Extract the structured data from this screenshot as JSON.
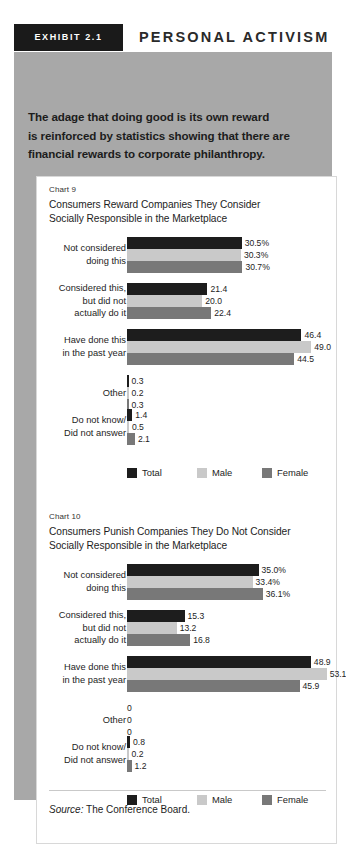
{
  "header": {
    "badge": "EXHIBIT 2.1",
    "title": "PERSONAL ACTIVISM"
  },
  "intro": {
    "line1": "The adage that doing good is its own reward",
    "line2": "is reinforced by statistics showing that there are",
    "line3": "financial rewards to corporate philanthropy."
  },
  "source": {
    "label": "Source:",
    "text": " The Conference Board."
  },
  "legend": {
    "items": [
      {
        "label": "Total",
        "color": "#1d1d1d"
      },
      {
        "label": "Male",
        "color": "#c9c9c9"
      },
      {
        "label": "Female",
        "color": "#787878"
      }
    ]
  },
  "colors": {
    "total": "#1d1d1d",
    "male": "#c9c9c9",
    "female": "#787878",
    "panel": "#a8a8a8",
    "badge": "#1a1a1a",
    "card": "#ffffff"
  },
  "chart_data": [
    {
      "type": "bar",
      "orientation": "horizontal",
      "number": "Chart 9",
      "title": "Consumers Reward Companies They Consider",
      "title2": "Socially Responsible in the Marketplace",
      "categories": [
        "Not considered doing this",
        "Considered this, but did not actually do it",
        "Have done this in the past year",
        "Other",
        "Do not know/ Did not answer"
      ],
      "category_lines": [
        [
          "Not considered",
          "doing this"
        ],
        [
          "Considered this,",
          "but did not",
          "actually do it"
        ],
        [
          "Have done this",
          "in the past year"
        ],
        [
          "Other"
        ],
        [
          "Do not know/",
          "Did not answer"
        ]
      ],
      "series": [
        {
          "name": "Total",
          "values": [
            30.5,
            21.4,
            46.4,
            0.3,
            1.4
          ],
          "labels": [
            "30.5%",
            "21.4",
            "46.4",
            "0.3",
            "1.4"
          ]
        },
        {
          "name": "Male",
          "values": [
            30.3,
            20.0,
            49.0,
            0.2,
            0.5
          ],
          "labels": [
            "30.3%",
            "20.0",
            "49.0",
            "0.2",
            "0.5"
          ]
        },
        {
          "name": "Female",
          "values": [
            30.7,
            22.4,
            44.5,
            0.3,
            2.1
          ],
          "labels": [
            "30.7%",
            "22.4",
            "44.5",
            "0.3",
            "2.1"
          ]
        }
      ],
      "xlabel": "",
      "ylabel": "",
      "xlim": [
        0,
        55
      ],
      "grid": false,
      "legend_position": "bottom"
    },
    {
      "type": "bar",
      "orientation": "horizontal",
      "number": "Chart 10",
      "title": "Consumers Punish Companies They Do Not Consider",
      "title2": "Socially Responsible in the Marketplace",
      "categories": [
        "Not considered doing this",
        "Considered this, but did not actually do it",
        "Have done this in the past year",
        "Other",
        "Do not know/ Did not answer"
      ],
      "category_lines": [
        [
          "Not considered",
          "doing this"
        ],
        [
          "Considered this,",
          "but did not",
          "actually do it"
        ],
        [
          "Have done this",
          "in the past year"
        ],
        [
          "Other"
        ],
        [
          "Do not know/",
          "Did not answer"
        ]
      ],
      "series": [
        {
          "name": "Total",
          "values": [
            35.0,
            15.3,
            48.9,
            0,
            0.8
          ],
          "labels": [
            "35.0%",
            "15.3",
            "48.9",
            "0",
            "0.8"
          ]
        },
        {
          "name": "Male",
          "values": [
            33.4,
            13.2,
            53.1,
            0,
            0.2
          ],
          "labels": [
            "33.4%",
            "13.2",
            "53.1",
            "0",
            "0.2"
          ]
        },
        {
          "name": "Female",
          "values": [
            36.1,
            16.8,
            45.9,
            0,
            1.2
          ],
          "labels": [
            "36.1%",
            "16.8",
            "45.9",
            "0",
            "1.2"
          ]
        }
      ],
      "xlabel": "",
      "ylabel": "",
      "xlim": [
        0,
        55
      ],
      "grid": false,
      "legend_position": "bottom"
    }
  ]
}
